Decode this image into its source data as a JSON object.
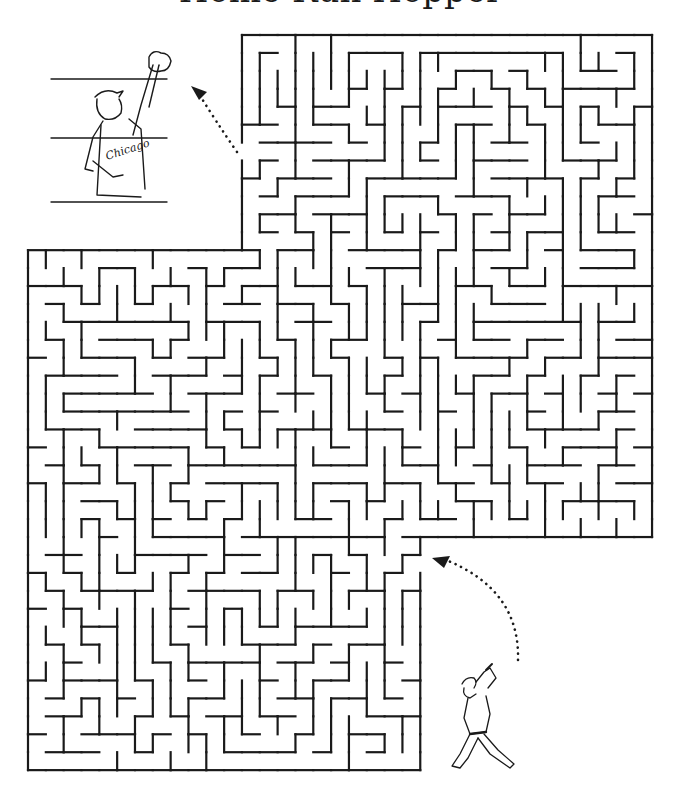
{
  "puzzle": {
    "title": "Home Run Hopper",
    "type": "maze",
    "start_label": "batter",
    "finish_label": "fan catching ball",
    "fan_jersey_text": "Chicago"
  },
  "maze": {
    "stroke_color": "#1a1a1a",
    "cell_w": 17.83,
    "cell_h": 17.93,
    "origin_x": 28,
    "origin_y": 35,
    "cols": 35,
    "rows": 41,
    "regions": [
      {
        "name": "top-right",
        "col_from": 12,
        "col_to": 34,
        "row_from": 0,
        "row_to": 11
      },
      {
        "name": "middle",
        "col_from": 0,
        "col_to": 34,
        "row_from": 12,
        "row_to": 27
      },
      {
        "name": "bottom-left",
        "col_from": 0,
        "col_to": 21,
        "row_from": 28,
        "row_to": 40
      }
    ],
    "entry": {
      "col": 21,
      "row": 29,
      "side": "right"
    },
    "exit": {
      "col": 12,
      "row": 6,
      "side": "left"
    }
  }
}
